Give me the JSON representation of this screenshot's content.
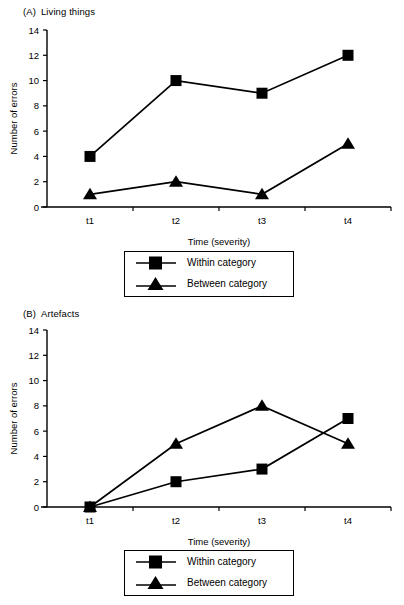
{
  "figure": {
    "panels": [
      {
        "tag": "(A)",
        "title": "Living things",
        "xlabel": "Time (severity)",
        "ylabel": "Number of errors"
      },
      {
        "tag": "(B)",
        "title": "Artefacts",
        "xlabel": "Time (severity)",
        "ylabel": "Number of errors"
      }
    ],
    "legend": {
      "within_label": "Within category",
      "between_label": "Between category"
    },
    "yticks": [
      "0",
      "2",
      "4",
      "6",
      "8",
      "10",
      "12",
      "14"
    ],
    "xticks": [
      "t1",
      "t2",
      "t3",
      "t4"
    ],
    "line_color": "#000000",
    "marker_color": "#000000",
    "background": "#ffffff"
  },
  "chart_data": [
    {
      "type": "line",
      "title": "(A) Living things",
      "xlabel": "Time (severity)",
      "ylabel": "Number of errors",
      "categories": [
        "t1",
        "t2",
        "t3",
        "t4"
      ],
      "ylim": [
        0,
        14
      ],
      "yticks": [
        0,
        2,
        4,
        6,
        8,
        10,
        12,
        14
      ],
      "grid": false,
      "legend_position": "below",
      "series": [
        {
          "name": "Within category",
          "marker": "square",
          "values": [
            4,
            10,
            9,
            12
          ]
        },
        {
          "name": "Between category",
          "marker": "triangle",
          "values": [
            1,
            2,
            1,
            5
          ]
        }
      ]
    },
    {
      "type": "line",
      "title": "(B) Artefacts",
      "xlabel": "Time (severity)",
      "ylabel": "Number of errors",
      "categories": [
        "t1",
        "t2",
        "t3",
        "t4"
      ],
      "ylim": [
        0,
        14
      ],
      "yticks": [
        0,
        2,
        4,
        6,
        8,
        10,
        12,
        14
      ],
      "grid": false,
      "legend_position": "below",
      "series": [
        {
          "name": "Within category",
          "marker": "square",
          "values": [
            0,
            2,
            3,
            7
          ]
        },
        {
          "name": "Between category",
          "marker": "triangle",
          "values": [
            0,
            5,
            8,
            5
          ]
        }
      ]
    }
  ]
}
